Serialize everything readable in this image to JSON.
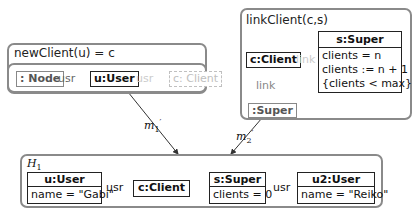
{
  "rules": {
    "newClient": {
      "title": "newClient(u) = c",
      "node_neg": ": Node",
      "edge1": "usr",
      "user": "u:User",
      "edge2": "usr",
      "client_new": "c: Client"
    },
    "linkClient": {
      "title": "linkClient(c,s)",
      "client": "c:Client",
      "link_new": "link",
      "link_del": "link",
      "super_del": ":Super",
      "super": {
        "name": "s:Super",
        "attrs": [
          "clients = n",
          "clients := n + 1",
          "{clients < max}"
        ]
      }
    }
  },
  "morphisms": {
    "m1": {
      "base": "m",
      "sub": "1",
      "sup": "′"
    },
    "m2": {
      "base": "m",
      "sub": "2",
      "sup": "′"
    }
  },
  "host": {
    "title": "H",
    "title_sub": "1",
    "user1": {
      "name": "u:User",
      "attr": "name = \"Gabi\""
    },
    "edge_usr1": "usr",
    "client": "c:Client",
    "super": {
      "name": "s:Super",
      "attr": "clients = 0"
    },
    "edge_usr2": "usr",
    "user2": {
      "name": "u2:User",
      "attr": "name = \"Reiko\""
    }
  }
}
